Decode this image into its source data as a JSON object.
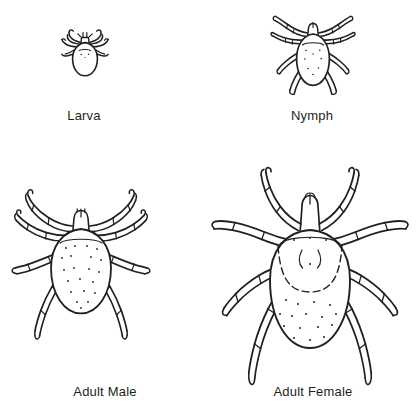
{
  "figure": {
    "background_color": "#ffffff",
    "ink_color": "#231f20",
    "width": 420,
    "height": 414,
    "columns": 2,
    "rows": 2
  },
  "stages": [
    {
      "id": "larva",
      "label": "Larva",
      "icon": "tick-larva-illustration",
      "leg_count": 6,
      "relative_size": "smallest",
      "row": 1,
      "column": 1
    },
    {
      "id": "nymph",
      "label": "Nymph",
      "icon": "tick-nymph-illustration",
      "leg_count": 8,
      "relative_size": "small",
      "row": 1,
      "column": 2
    },
    {
      "id": "adult-male",
      "label": "Adult Male",
      "icon": "tick-adult-male-illustration",
      "leg_count": 8,
      "relative_size": "large",
      "row": 2,
      "column": 1
    },
    {
      "id": "adult-female",
      "label": "Adult Female",
      "icon": "tick-adult-female-illustration",
      "leg_count": 8,
      "relative_size": "largest",
      "row": 2,
      "column": 2
    }
  ]
}
